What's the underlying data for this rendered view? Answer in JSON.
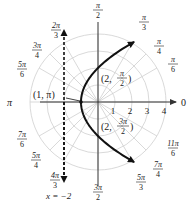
{
  "diagram": {
    "title": "",
    "type": "polar-graph",
    "curve": {
      "equation": "r = 2/(1 - cos θ)",
      "kind": "parabola",
      "color": "#111111"
    },
    "directrix": {
      "label": "x = −2",
      "style": "dashed",
      "color": "#111111"
    },
    "polar_axis_label": "0",
    "pi_label": "π",
    "radial_ticks": [
      "1",
      "2",
      "3",
      "4"
    ],
    "angle_labels": [
      {
        "num": "π",
        "den": "2",
        "angle": "pi/2"
      },
      {
        "num": "π",
        "den": "3",
        "angle": "pi/3"
      },
      {
        "num": "π",
        "den": "4",
        "angle": "pi/4"
      },
      {
        "num": "π",
        "den": "6",
        "angle": "pi/6"
      },
      {
        "num": "2π",
        "den": "3",
        "angle": "2pi/3"
      },
      {
        "num": "3π",
        "den": "4",
        "angle": "3pi/4"
      },
      {
        "num": "5π",
        "den": "6",
        "angle": "5pi/6"
      },
      {
        "num": "7π",
        "den": "6",
        "angle": "7pi/6"
      },
      {
        "num": "5π",
        "den": "4",
        "angle": "5pi/4"
      },
      {
        "num": "4π",
        "den": "3",
        "angle": "4pi/3"
      },
      {
        "num": "3π",
        "den": "2",
        "angle": "3pi/2"
      },
      {
        "num": "5π",
        "den": "3",
        "angle": "5pi/3"
      },
      {
        "num": "7π",
        "den": "4",
        "angle": "7pi/4"
      },
      {
        "num": "11π",
        "den": "6",
        "angle": "11pi/6"
      }
    ],
    "points": [
      {
        "label": "(1, π)",
        "r": "1",
        "theta": "π"
      },
      {
        "label_prefix": "(2, ",
        "num": "π",
        "den": "2",
        "r": "2",
        "theta": "π/2"
      },
      {
        "label_prefix": "(2, ",
        "num": "3π",
        "den": "2",
        "r": "2",
        "theta": "3π/2"
      }
    ]
  }
}
